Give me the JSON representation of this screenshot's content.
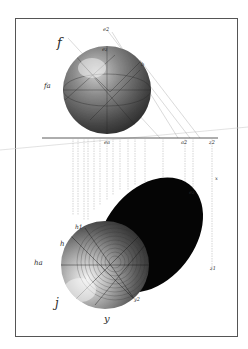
{
  "figure": {
    "colors": {
      "paper": "#ffffff",
      "ink": "#1a1a1a",
      "frame": "#555555",
      "shadow": "#050505",
      "hatch": "#6a6a6a"
    },
    "labels": {
      "f": "f",
      "fa": "fa",
      "e2": "e2",
      "ez_top": "ez",
      "b": "b",
      "ea": "ea",
      "a2": "a2",
      "z2": "z2",
      "x": "x",
      "ez_shadow": "ez",
      "z1": "z1",
      "h": "h",
      "h1": "h1",
      "ha": "ha",
      "j": "j",
      "y": "y",
      "y2": "y2"
    }
  }
}
